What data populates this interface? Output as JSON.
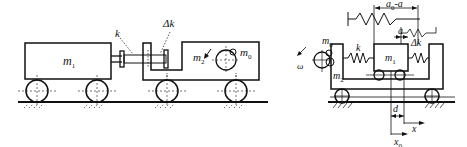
{
  "left_figure": {
    "labels": {
      "m1": "m",
      "m1_sub": "1",
      "k": "k",
      "dk": "Δk",
      "m2": "m",
      "m2_sub": "2",
      "m0": "m",
      "m0_sub": "0"
    }
  },
  "right_figure": {
    "labels": {
      "a0_minus_a": "a",
      "a0_sub": "0",
      "a0_rest": "-a",
      "a": "a",
      "dk": "Δk",
      "k": "k",
      "m0": "m",
      "m0_sub": "0",
      "m1": "m",
      "m1_sub": "1",
      "m2": "m",
      "m2_sub": "2",
      "omega": "ω",
      "d": "d",
      "x": "x",
      "x0": "x",
      "x0_sub": "0"
    }
  },
  "colors": {
    "stroke": "#111111",
    "background": "#ffffff"
  }
}
